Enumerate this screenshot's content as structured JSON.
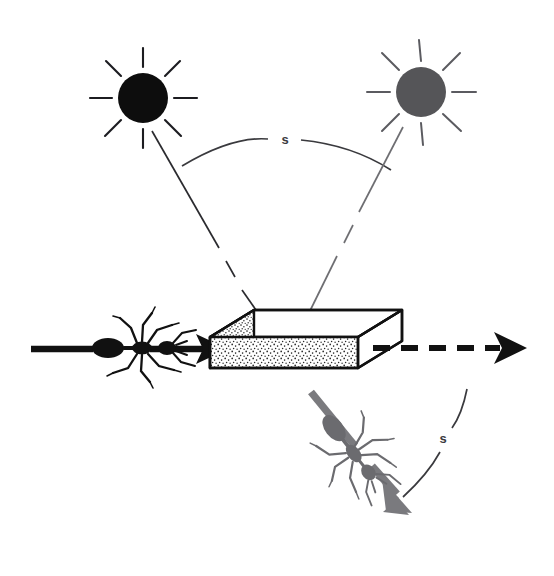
{
  "figure": {
    "type": "scientific-diagram",
    "background_color": "#ffffff"
  },
  "labels": {
    "top_arc_label": "s",
    "bottom_arc_label": "s"
  },
  "colors": {
    "sun_dark": "#0d0d0d",
    "sun_gray": "#555558",
    "line_dark": "#2b2b2f",
    "line_gray": "#6e6e72",
    "ant_dark": "#111111",
    "ant_gray": "#6b6b6f",
    "arrow_dark": "#111111",
    "arrow_gray": "#7a7a7e",
    "box_outline": "#111111",
    "box_top_fill": "#ffffff",
    "box_side_fill": "#ffffff",
    "stipple": "#2a2a2a",
    "label_text": "#3a3a3e"
  },
  "elements": {
    "sun_left": {
      "name": "dark sun",
      "fill": "#0d0d0d",
      "center_x": 143,
      "center_y": 98,
      "radius": 25,
      "rays": 8,
      "ray_inner": 31,
      "ray_outer": 50
    },
    "sun_right": {
      "name": "gray sun",
      "fill": "#555558",
      "center_x": 421,
      "center_y": 92,
      "radius": 25,
      "rays": 8,
      "ray_inner": 31,
      "ray_outer": 52
    },
    "top_arc": {
      "name": "angular separation arc between suns",
      "start_x": 182,
      "start_y": 166,
      "peak_x": 285,
      "peak_y": 138,
      "end_x": 391,
      "end_y": 170,
      "label": "s",
      "label_x": 285,
      "label_y": 143
    },
    "bottom_arc": {
      "name": "angular separation arc between outbound and return heading",
      "start_x": 466,
      "start_y": 390,
      "peak_x": 455,
      "peak_y": 448,
      "end_x": 404,
      "end_y": 497,
      "label": "s",
      "label_x": 443,
      "label_y": 443
    },
    "box": {
      "name": "stippled rectangular block (landmark)",
      "top_face": "white",
      "side_faces": "stippled",
      "front_top_left_x": 210,
      "front_top_left_y": 337,
      "front_bottom_right_x": 358,
      "front_bottom_right_y": 385,
      "depth_dx": 44,
      "depth_dy": -27
    },
    "ant_left": {
      "name": "black ant walking right",
      "color": "#111111",
      "x": 120,
      "y": 345,
      "heading_deg": 0
    },
    "ant_lower": {
      "name": "gray ant walking down-right",
      "color": "#6b6b6f",
      "x": 355,
      "y": 455,
      "heading_deg": 55
    },
    "arrow_incoming": {
      "name": "solid black arrow toward the block",
      "color": "#111111",
      "style": "solid",
      "from_x": 30,
      "from_y": 349,
      "to_x": 205,
      "to_y": 349
    },
    "arrow_outgoing_dashed": {
      "name": "dashed black arrow continuing right",
      "color": "#111111",
      "style": "dashed",
      "from_x": 373,
      "from_y": 348,
      "to_x": 524,
      "to_y": 348
    },
    "arrow_deflected": {
      "name": "thick gray arrow deflected down-right",
      "color": "#7a7a7e",
      "style": "solid-thick",
      "from_x": 310,
      "from_y": 390,
      "to_x": 404,
      "to_y": 505
    },
    "ray_left": {
      "name": "light ray from dark sun to block",
      "color": "#2b2b2f",
      "from_x": 152,
      "from_y": 130,
      "to_x": 262,
      "to_y": 318,
      "broken": true
    },
    "ray_right": {
      "name": "light ray from gray sun to block",
      "color": "#6e6e72",
      "from_x": 404,
      "from_y": 126,
      "to_x": 305,
      "to_y": 320,
      "broken": true
    }
  }
}
